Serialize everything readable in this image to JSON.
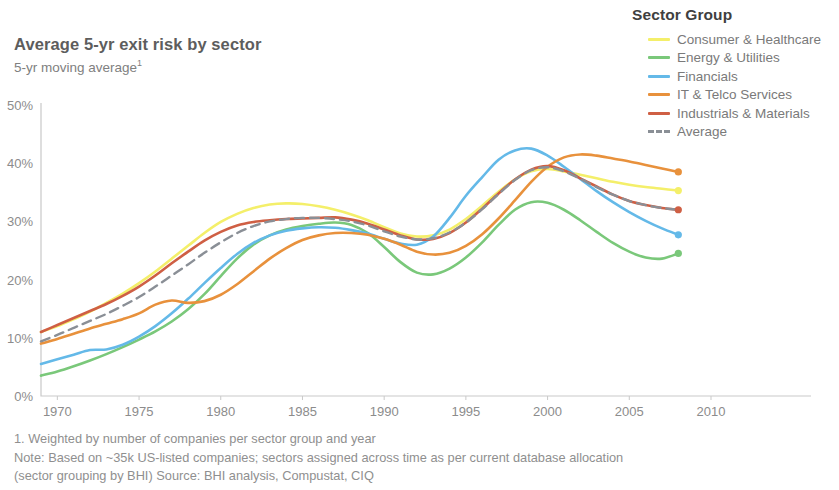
{
  "header": {
    "title": "Average 5-yr exit risk by sector",
    "subtitle": "5-yr moving average",
    "subtitle_footnote_marker": "1"
  },
  "legend": {
    "title": "Sector Group",
    "items": [
      {
        "label": "Consumer & Healthcare",
        "color": "#f4ef6a",
        "style": "solid"
      },
      {
        "label": "Energy & Utilities",
        "color": "#7ac87a",
        "style": "solid"
      },
      {
        "label": "Financials",
        "color": "#64b9e8",
        "style": "solid"
      },
      {
        "label": "IT & Telco Services",
        "color": "#e8913c",
        "style": "solid"
      },
      {
        "label": "Industrials & Materials",
        "color": "#cf5f44",
        "style": "solid"
      },
      {
        "label": "Average",
        "color": "#8a8f96",
        "style": "dashed"
      }
    ]
  },
  "footnotes": [
    "1. Weighted by number of companies per sector group and year",
    "Note: Based on ~35k US-listed companies; sectors assigned across time as per current database allocation",
    "(sector grouping by BHI) Source: BHI analysis, Compustat, CIQ"
  ],
  "chart_data": {
    "type": "line",
    "title": "Average 5-yr exit risk by sector",
    "subtitle": "5-yr moving average",
    "xlabel": "",
    "ylabel": "",
    "xlim": [
      1969,
      2010
    ],
    "ylim": [
      0,
      50
    ],
    "y_tick_labels": [
      "0%",
      "10%",
      "20%",
      "30%",
      "40%",
      "50%"
    ],
    "y_ticks": [
      0,
      10,
      20,
      30,
      40,
      50
    ],
    "x_ticks": [
      1970,
      1975,
      1980,
      1985,
      1990,
      1995,
      2000,
      2005,
      2010
    ],
    "x_tick_labels": [
      "1970",
      "1975",
      "1980",
      "1985",
      "1990",
      "1995",
      "2000",
      "2005",
      "2010"
    ],
    "grid": false,
    "legend_position": "top-right",
    "units": "percent",
    "endpoint_markers": true,
    "x": [
      1969,
      1970,
      1971,
      1972,
      1973,
      1974,
      1975,
      1976,
      1977,
      1978,
      1979,
      1980,
      1981,
      1982,
      1983,
      1984,
      1985,
      1986,
      1987,
      1988,
      1989,
      1990,
      1991,
      1992,
      1993,
      1994,
      1995,
      1996,
      1997,
      1998,
      1999,
      2000,
      2001,
      2002,
      2003,
      2004,
      2005,
      2006,
      2007,
      2008
    ],
    "series": [
      {
        "name": "Consumer & Healthcare",
        "color": "#f4ef6a",
        "style": "solid",
        "values": [
          11.0,
          12.0,
          13.2,
          14.5,
          16.0,
          17.6,
          19.4,
          21.4,
          23.6,
          25.8,
          28.0,
          29.9,
          31.3,
          32.3,
          32.9,
          33.1,
          33.0,
          32.6,
          32.0,
          31.2,
          30.2,
          29.0,
          27.9,
          27.4,
          27.6,
          28.6,
          30.4,
          32.7,
          35.1,
          37.2,
          38.6,
          39.0,
          38.6,
          38.0,
          37.4,
          36.8,
          36.3,
          35.9,
          35.6,
          35.3
        ],
        "endpoint_value": 35.3
      },
      {
        "name": "Energy & Utilities",
        "color": "#7ac87a",
        "style": "solid",
        "values": [
          3.5,
          4.2,
          5.1,
          6.1,
          7.2,
          8.4,
          9.7,
          11.1,
          12.8,
          14.9,
          17.5,
          20.6,
          23.6,
          26.0,
          27.6,
          28.6,
          29.2,
          29.6,
          29.8,
          29.4,
          28.0,
          25.6,
          23.0,
          21.2,
          20.9,
          21.9,
          23.8,
          26.4,
          29.4,
          32.0,
          33.3,
          33.2,
          32.0,
          30.2,
          28.2,
          26.3,
          24.8,
          23.8,
          23.6,
          24.5
        ],
        "endpoint_value": 24.5
      },
      {
        "name": "Financials",
        "color": "#64b9e8",
        "style": "solid",
        "values": [
          5.5,
          6.3,
          7.1,
          7.9,
          8.0,
          8.8,
          10.2,
          12.0,
          14.2,
          16.7,
          19.4,
          22.0,
          24.4,
          26.3,
          27.6,
          28.4,
          28.8,
          29.0,
          28.9,
          28.5,
          27.9,
          27.0,
          26.2,
          26.0,
          27.4,
          30.6,
          34.4,
          37.6,
          40.6,
          42.2,
          42.5,
          41.3,
          39.4,
          37.3,
          35.2,
          33.3,
          31.6,
          30.1,
          28.8,
          27.7
        ],
        "endpoint_value": 27.7
      },
      {
        "name": "IT & Telco Services",
        "color": "#e8913c",
        "style": "solid",
        "values": [
          9.0,
          9.8,
          10.7,
          11.6,
          12.4,
          13.2,
          14.2,
          15.7,
          16.4,
          16.0,
          16.3,
          17.4,
          19.2,
          21.4,
          23.6,
          25.4,
          26.8,
          27.6,
          28.0,
          28.0,
          27.7,
          27.0,
          26.0,
          24.8,
          24.3,
          24.6,
          25.8,
          27.8,
          30.5,
          33.6,
          36.8,
          39.4,
          41.0,
          41.5,
          41.3,
          40.8,
          40.3,
          39.7,
          39.1,
          38.5
        ],
        "endpoint_value": 38.5
      },
      {
        "name": "Industrials & Materials",
        "color": "#cf5f44",
        "style": "solid",
        "values": [
          11.0,
          12.2,
          13.4,
          14.6,
          15.8,
          17.2,
          18.8,
          20.7,
          22.8,
          24.8,
          26.7,
          28.2,
          29.3,
          29.9,
          30.2,
          30.4,
          30.5,
          30.6,
          30.7,
          30.3,
          29.6,
          28.6,
          27.6,
          26.9,
          27.0,
          28.0,
          29.8,
          32.2,
          34.8,
          37.2,
          38.9,
          39.5,
          38.8,
          37.4,
          36.0,
          34.6,
          33.5,
          32.8,
          32.3,
          32.0
        ],
        "endpoint_value": 32.0
      },
      {
        "name": "Average",
        "color": "#8a8f96",
        "style": "dashed",
        "values": [
          9.4,
          10.5,
          11.7,
          12.9,
          14.1,
          15.5,
          17.0,
          18.8,
          20.7,
          22.6,
          24.6,
          26.4,
          28.0,
          29.2,
          30.0,
          30.4,
          30.6,
          30.6,
          30.4,
          30.0,
          29.3,
          28.3,
          27.4,
          26.9,
          27.1,
          28.1,
          29.8,
          32.1,
          34.7,
          37.1,
          38.8,
          39.3,
          38.6,
          37.3,
          35.9,
          34.6,
          33.5,
          32.8,
          32.3,
          32.0
        ],
        "endpoint_value": 32.0
      }
    ]
  }
}
